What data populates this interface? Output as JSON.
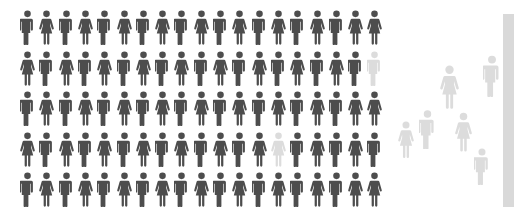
{
  "canvas": {
    "width": 516,
    "height": 221,
    "background": "#ffffff"
  },
  "colors": {
    "figure_dark": "#4d4d4d",
    "figure_light": "#dcdcdc",
    "edge_bar": "#d9d9d9",
    "background": "#ffffff"
  },
  "chart_data": {
    "type": "pictogram",
    "title": "",
    "subtitle": "",
    "xlabel": "",
    "ylabel": "",
    "legend": [],
    "annotations": [],
    "icon_semantics": {
      "male": "male-person-icon",
      "female": "female-person-icon"
    },
    "grid": {
      "rows": 5,
      "columns": 19,
      "total_figures": 95,
      "dark_count": 93,
      "highlighted_count": 2,
      "origin_x": 20,
      "origin_y": 10,
      "pitch_x": 19.3,
      "pitch_y": 40.5,
      "figure_width": 15,
      "figure_height": 35,
      "rows_data": [
        {
          "row": 1,
          "genders": [
            "male",
            "female",
            "male",
            "female",
            "male",
            "female",
            "male",
            "female",
            "male",
            "female",
            "male",
            "female",
            "male",
            "female",
            "male",
            "female",
            "male",
            "female",
            "female"
          ],
          "highlight_columns": []
        },
        {
          "row": 2,
          "genders": [
            "female",
            "male",
            "female",
            "male",
            "female",
            "male",
            "female",
            "male",
            "female",
            "male",
            "female",
            "male",
            "female",
            "male",
            "female",
            "male",
            "female",
            "male",
            "male"
          ],
          "highlight_columns": [
            19
          ]
        },
        {
          "row": 3,
          "genders": [
            "male",
            "female",
            "male",
            "female",
            "male",
            "female",
            "male",
            "female",
            "male",
            "female",
            "male",
            "female",
            "male",
            "female",
            "male",
            "female",
            "male",
            "female",
            "female"
          ],
          "highlight_columns": []
        },
        {
          "row": 4,
          "genders": [
            "female",
            "male",
            "female",
            "male",
            "female",
            "male",
            "female",
            "male",
            "female",
            "male",
            "female",
            "male",
            "female",
            "female",
            "male",
            "female",
            "male",
            "female",
            "male"
          ],
          "highlight_columns": [
            14
          ]
        },
        {
          "row": 5,
          "genders": [
            "male",
            "female",
            "male",
            "female",
            "male",
            "female",
            "male",
            "female",
            "male",
            "female",
            "male",
            "female",
            "male",
            "female",
            "male",
            "female",
            "male",
            "female",
            "female"
          ],
          "highlight_columns": []
        }
      ]
    },
    "scatter": {
      "count": 6,
      "description": "dispersed light-gray figures to the right of the grid",
      "figures": [
        {
          "id": 1,
          "gender": "female",
          "x": 398,
          "y": 121,
          "width": 16,
          "height": 37
        },
        {
          "id": 2,
          "gender": "male",
          "x": 419,
          "y": 110,
          "width": 17,
          "height": 39
        },
        {
          "id": 3,
          "gender": "female",
          "x": 440,
          "y": 65,
          "width": 19,
          "height": 44
        },
        {
          "id": 4,
          "gender": "female",
          "x": 455,
          "y": 112,
          "width": 17,
          "height": 40
        },
        {
          "id": 5,
          "gender": "male",
          "x": 474,
          "y": 148,
          "width": 16,
          "height": 37
        },
        {
          "id": 6,
          "gender": "male",
          "x": 483,
          "y": 55,
          "width": 18,
          "height": 42
        }
      ]
    },
    "edge_bar": {
      "x": 503,
      "y": 14,
      "width": 11,
      "height": 193,
      "color": "#d9d9d9"
    }
  }
}
